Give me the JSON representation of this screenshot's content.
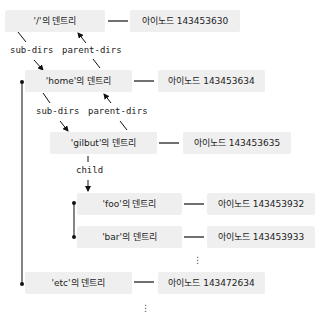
{
  "dentries": [
    {
      "id": "root",
      "label": "'/'의 덴트리",
      "inode": "아이노드 143453630"
    },
    {
      "id": "home",
      "label": "'home'의 덴트리",
      "inode": "아이노드 143453634"
    },
    {
      "id": "gilbut",
      "label": "'gilbut'의 덴트리",
      "inode": "아이노드 143453635"
    },
    {
      "id": "foo",
      "label": "'foo'의 덴트리",
      "inode": "아이노드 143453932"
    },
    {
      "id": "bar",
      "label": "'bar'의 덴트리",
      "inode": "아이노드 143453933"
    },
    {
      "id": "etc",
      "label": "'etc'의 덴트리",
      "inode": "아이노드 143472634"
    }
  ],
  "edge_labels": {
    "sub_dirs_1": "sub-dirs",
    "parent_dirs_1": "parent-dirs",
    "sub_dirs_2": "sub-dirs",
    "parent_dirs_2": "parent-dirs",
    "child": "child"
  },
  "ellipsis": "⋮"
}
